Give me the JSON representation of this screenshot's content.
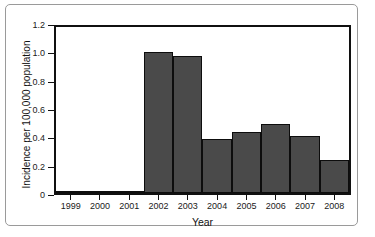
{
  "chart_data": {
    "type": "bar",
    "title": "",
    "subtitle": "",
    "xlabel": "Year",
    "ylabel": "Incidence per 100,000 population",
    "categories": [
      "1999",
      "2000",
      "2001",
      "2002",
      "2003",
      "2004",
      "2005",
      "2006",
      "2007",
      "2008"
    ],
    "values": [
      0.015,
      0.01,
      0.015,
      1.02,
      0.99,
      0.39,
      0.44,
      0.5,
      0.41,
      0.24
    ],
    "ylim": [
      0,
      1.2
    ],
    "yticks": [
      "0",
      "0.2",
      "0.4",
      "0.6",
      "0.8",
      "1.0",
      "1.2"
    ],
    "ytick_values": [
      0,
      0.2,
      0.4,
      0.6,
      0.8,
      1.0,
      1.2
    ],
    "grid": false,
    "legend": "none",
    "bar_gap": 0,
    "series": [
      {
        "name": "Incidence",
        "values": [
          0.015,
          0.01,
          0.015,
          1.02,
          0.99,
          0.39,
          0.44,
          0.5,
          0.41,
          0.24
        ]
      }
    ],
    "colors": {
      "bar_fill": "#4a4a4a",
      "bar_edge": "#0d0d0d",
      "axis": "#101010",
      "text": "#1a1a1a",
      "plot_background": "#ffffff",
      "card_border": "#9a9a9a"
    }
  }
}
